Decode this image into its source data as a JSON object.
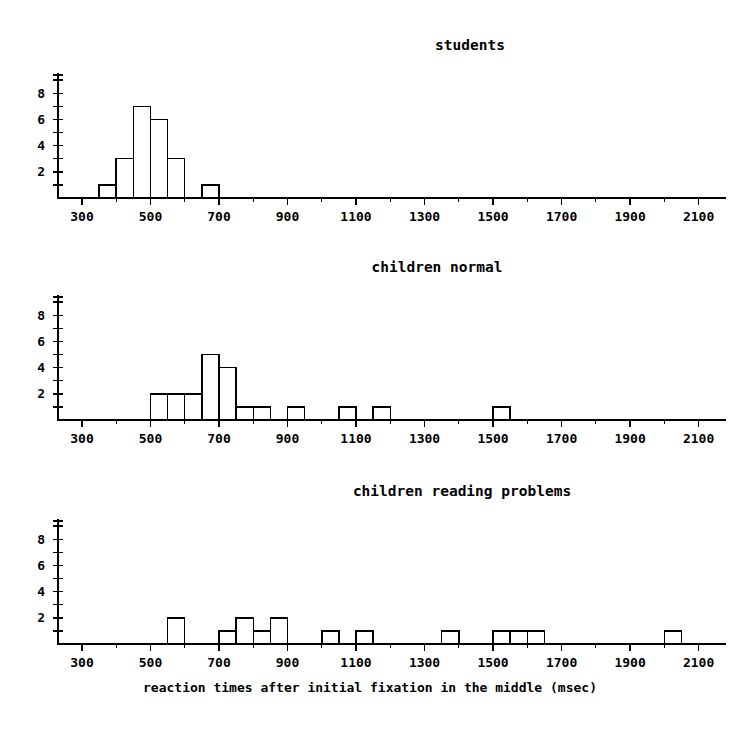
{
  "figure": {
    "xlabel": "reaction times after initial fixation in the middle (msec)",
    "background_color": "#ffffff",
    "ink_color": "#000000"
  },
  "chart_data": [
    {
      "type": "bar",
      "title": "students",
      "xlabel": "reaction times after initial fixation in the middle (msec)",
      "ylabel": "",
      "xlim": [
        230,
        2180
      ],
      "ylim": [
        0,
        9.4
      ],
      "grid": false,
      "legend": "none",
      "bin_width": 50,
      "x_tick_labels": [
        "300",
        "500",
        "700",
        "900",
        "1100",
        "1300",
        "1500",
        "1700",
        "1900",
        "2100"
      ],
      "x_tick_values": [
        300,
        500,
        700,
        900,
        1100,
        1300,
        1500,
        1700,
        1900,
        2100
      ],
      "x_minor_tick_step": 100,
      "y_tick_labels": [
        "2",
        "4",
        "6",
        "8"
      ],
      "y_tick_values": [
        2,
        4,
        6,
        8
      ],
      "y_minor_tick_values": [
        1,
        2,
        3,
        4,
        5,
        6,
        7,
        8,
        9
      ],
      "bins": [
        {
          "start": 350,
          "end": 400,
          "count": 1
        },
        {
          "start": 400,
          "end": 450,
          "count": 3
        },
        {
          "start": 450,
          "end": 500,
          "count": 7
        },
        {
          "start": 500,
          "end": 550,
          "count": 6
        },
        {
          "start": 550,
          "end": 600,
          "count": 3
        },
        {
          "start": 650,
          "end": 700,
          "count": 1
        }
      ],
      "total_count": 21
    },
    {
      "type": "bar",
      "title": "children normal",
      "xlabel": "reaction times after initial fixation in the middle (msec)",
      "ylabel": "",
      "xlim": [
        230,
        2180
      ],
      "ylim": [
        0,
        9.4
      ],
      "grid": false,
      "legend": "none",
      "bin_width": 50,
      "x_tick_labels": [
        "300",
        "500",
        "700",
        "900",
        "1100",
        "1300",
        "1500",
        "1700",
        "1900",
        "2100"
      ],
      "x_tick_values": [
        300,
        500,
        700,
        900,
        1100,
        1300,
        1500,
        1700,
        1900,
        2100
      ],
      "x_minor_tick_step": 100,
      "y_tick_labels": [
        "2",
        "4",
        "6",
        "8"
      ],
      "y_tick_values": [
        2,
        4,
        6,
        8
      ],
      "y_minor_tick_values": [
        1,
        2,
        3,
        4,
        5,
        6,
        7,
        8,
        9
      ],
      "bins": [
        {
          "start": 500,
          "end": 550,
          "count": 2
        },
        {
          "start": 550,
          "end": 600,
          "count": 2
        },
        {
          "start": 600,
          "end": 650,
          "count": 2
        },
        {
          "start": 650,
          "end": 700,
          "count": 5
        },
        {
          "start": 700,
          "end": 750,
          "count": 4
        },
        {
          "start": 750,
          "end": 800,
          "count": 1
        },
        {
          "start": 800,
          "end": 850,
          "count": 1
        },
        {
          "start": 900,
          "end": 950,
          "count": 1
        },
        {
          "start": 1050,
          "end": 1100,
          "count": 1
        },
        {
          "start": 1150,
          "end": 1200,
          "count": 1
        },
        {
          "start": 1500,
          "end": 1550,
          "count": 1
        }
      ],
      "total_count": 21
    },
    {
      "type": "bar",
      "title": "children reading problems",
      "xlabel": "reaction times after initial fixation in the middle (msec)",
      "ylabel": "",
      "xlim": [
        230,
        2180
      ],
      "ylim": [
        0,
        9.4
      ],
      "grid": false,
      "legend": "none",
      "bin_width": 50,
      "x_tick_labels": [
        "300",
        "500",
        "700",
        "900",
        "1100",
        "1300",
        "1500",
        "1700",
        "1900",
        "2100"
      ],
      "x_tick_values": [
        300,
        500,
        700,
        900,
        1100,
        1300,
        1500,
        1700,
        1900,
        2100
      ],
      "x_minor_tick_step": 100,
      "y_tick_labels": [
        "2",
        "4",
        "6",
        "8"
      ],
      "y_tick_values": [
        2,
        4,
        6,
        8
      ],
      "y_minor_tick_values": [
        1,
        2,
        3,
        4,
        5,
        6,
        7,
        8,
        9
      ],
      "bins": [
        {
          "start": 550,
          "end": 600,
          "count": 2
        },
        {
          "start": 700,
          "end": 750,
          "count": 1
        },
        {
          "start": 750,
          "end": 800,
          "count": 2
        },
        {
          "start": 800,
          "end": 850,
          "count": 1
        },
        {
          "start": 850,
          "end": 900,
          "count": 2
        },
        {
          "start": 1000,
          "end": 1050,
          "count": 1
        },
        {
          "start": 1100,
          "end": 1150,
          "count": 1
        },
        {
          "start": 1350,
          "end": 1400,
          "count": 1
        },
        {
          "start": 1500,
          "end": 1550,
          "count": 1
        },
        {
          "start": 1550,
          "end": 1600,
          "count": 1
        },
        {
          "start": 1600,
          "end": 1650,
          "count": 1
        },
        {
          "start": 2000,
          "end": 2050,
          "count": 1
        }
      ],
      "total_count": 15
    }
  ]
}
